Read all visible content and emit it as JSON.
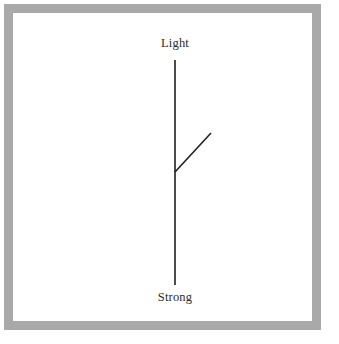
{
  "figure": {
    "name": "branching-line-diagram",
    "background_color": "#ffffff",
    "frame": {
      "name": "gray-picture-frame",
      "color": "#a9a9a9",
      "thickness_px": 9,
      "inset_px": 4
    },
    "canvas": {
      "color": "#ffffff"
    }
  },
  "labels": {
    "top": "Light",
    "bottom": "Strong"
  },
  "label_positions": {
    "top": {
      "x": 175,
      "y": 43
    },
    "bottom": {
      "x": 175,
      "y": 297
    }
  },
  "strokes": {
    "color": "#1f1f1f",
    "width_px": 1.6
  },
  "lines": [
    {
      "name": "main-vertical-line",
      "x1": 175,
      "y1": 60,
      "x2": 175,
      "y2": 285
    },
    {
      "name": "diagonal-branch-line",
      "x1": 175,
      "y1": 172,
      "x2": 211,
      "y2": 133
    }
  ],
  "junction": {
    "name": "branch-junction",
    "x": 175,
    "y": 172
  }
}
